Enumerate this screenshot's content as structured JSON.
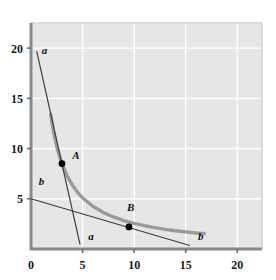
{
  "chart_data": {
    "type": "line",
    "title": "",
    "xlabel": "",
    "ylabel": "",
    "xlim": [
      0,
      22.4
    ],
    "ylim": [
      0,
      22.4
    ],
    "xticks": [
      0,
      5,
      10,
      15,
      20
    ],
    "xtick_labels": [
      "0",
      "5",
      "10",
      "15",
      "20"
    ],
    "yticks": [
      5,
      10,
      15,
      20
    ],
    "ytick_labels": [
      "5",
      "10",
      "15",
      "20"
    ],
    "grid": true,
    "grid_color": "#ffffff",
    "plot_background": "#e6e6e6",
    "axis_color": "#8a8a8a",
    "legend": "none",
    "series": [
      {
        "name": "indifference-curve",
        "type": "curve",
        "style": "thick",
        "color": "#9a9a9a",
        "equation": "x*y = 25.5",
        "x_start": 1.9,
        "x_end": 16.8,
        "points": [
          [
            1.9,
            13.42
          ],
          [
            2.2,
            11.59
          ],
          [
            2.5,
            10.2
          ],
          [
            2.8,
            9.11
          ],
          [
            3.0,
            8.5
          ],
          [
            3.5,
            7.29
          ],
          [
            4.0,
            6.38
          ],
          [
            4.5,
            5.67
          ],
          [
            5.0,
            5.1
          ],
          [
            6.0,
            4.25
          ],
          [
            7.0,
            3.64
          ],
          [
            8.0,
            3.19
          ],
          [
            9.0,
            2.83
          ],
          [
            9.5,
            2.68
          ],
          [
            10.0,
            2.55
          ],
          [
            11.0,
            2.32
          ],
          [
            12.0,
            2.13
          ],
          [
            13.0,
            1.96
          ],
          [
            14.0,
            1.82
          ],
          [
            15.0,
            1.7
          ],
          [
            16.0,
            1.59
          ],
          [
            16.8,
            1.52
          ]
        ]
      },
      {
        "name": "budget-line-a",
        "type": "line",
        "style": "thin",
        "color": "#3d3d3d",
        "from": [
          0.55,
          19.7
        ],
        "to": [
          4.75,
          0.45
        ]
      },
      {
        "name": "budget-line-b",
        "type": "line",
        "style": "thin",
        "color": "#3d3d3d",
        "from": [
          0.0,
          5.0
        ],
        "to": [
          15.4,
          0.35
        ]
      }
    ],
    "annotations": [
      {
        "name": "label-a-top",
        "text": "a",
        "x": 1.05,
        "y": 19.4,
        "style": "italic"
      },
      {
        "name": "label-a-bottom",
        "text": "a",
        "x": 5.55,
        "y": 0.85,
        "style": "italic"
      },
      {
        "name": "label-b-left",
        "text": "b",
        "x": 0.75,
        "y": 6.4,
        "style": "italic"
      },
      {
        "name": "label-b-right",
        "text": "b",
        "x": 16.2,
        "y": 0.85,
        "style": "italic"
      }
    ],
    "markers": [
      {
        "name": "point-A",
        "label": "A",
        "x": 3.0,
        "y": 8.5,
        "color": "#000000",
        "label_dx": 1.0,
        "label_dy": 0.45
      },
      {
        "name": "point-B",
        "label": "B",
        "x": 9.5,
        "y": 2.2,
        "color": "#000000",
        "label_dx": -0.2,
        "label_dy": 1.55
      }
    ]
  }
}
